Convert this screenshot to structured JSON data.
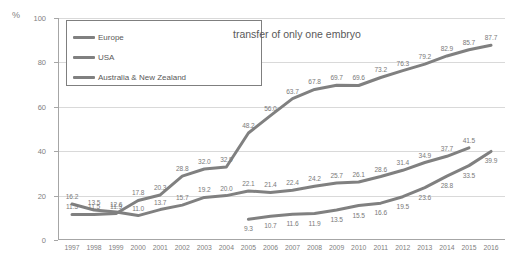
{
  "chart_data": {
    "type": "line",
    "title": "transfer of only one embryo",
    "xlabel": "",
    "ylabel": "%",
    "ylim": [
      0,
      100
    ],
    "yticks": [
      0,
      20,
      40,
      60,
      80,
      100
    ],
    "grid": true,
    "legend_position": "top-left",
    "x": [
      1997,
      1998,
      1999,
      2000,
      2001,
      2002,
      2003,
      2004,
      2005,
      2006,
      2007,
      2008,
      2009,
      2010,
      2011,
      2012,
      2013,
      2014,
      2015,
      2016
    ],
    "categories": [
      "1997",
      "1998",
      "1999",
      "2000",
      "2001",
      "2002",
      "2003",
      "2004",
      "2005",
      "2006",
      "2007",
      "2008",
      "2009",
      "2010",
      "2011",
      "2012",
      "2013",
      "2014",
      "2015",
      "2016"
    ],
    "series": [
      {
        "name": "Europe",
        "color": "#808080",
        "values": [
          16.2,
          13.5,
          12.6,
          11.0,
          13.7,
          15.7,
          19.2,
          20.0,
          22.1,
          21.4,
          22.4,
          24.2,
          25.7,
          26.1,
          28.6,
          31.4,
          34.9,
          37.7,
          41.5,
          null
        ],
        "labels": [
          "16.2",
          "13.5",
          "12.6",
          "11.0",
          "13.7",
          "15.7",
          "19.2",
          "20.0",
          "22.1",
          "21.4",
          "22.4",
          "24.2",
          "25.7",
          "26.1",
          "28.6",
          "31.4",
          "34.9",
          "37.7",
          "41.5",
          ""
        ]
      },
      {
        "name": "USA",
        "color": "#808080",
        "values": [
          null,
          null,
          null,
          null,
          null,
          null,
          null,
          null,
          9.3,
          10.7,
          11.6,
          11.9,
          13.5,
          15.5,
          16.6,
          19.5,
          23.6,
          28.8,
          33.5,
          39.9
        ],
        "labels": [
          "",
          "",
          "",
          "",
          "",
          "",
          "",
          "",
          "9.3",
          "10.7",
          "11.6",
          "11.9",
          "13.5",
          "15.5",
          "16.6",
          "19.5",
          "23.6",
          "28.8",
          "33.5",
          "39.9"
        ]
      },
      {
        "name": "Australia & New Zealand",
        "color": "#808080",
        "values": [
          11.5,
          11.5,
          11.9,
          17.8,
          20.3,
          28.8,
          32.0,
          32.9,
          48.2,
          56.0,
          63.7,
          67.8,
          69.7,
          69.6,
          73.2,
          76.3,
          79.2,
          82.9,
          85.7,
          87.7
        ],
        "labels": [
          "11.5",
          "11.5",
          "11.9",
          "17.8",
          "20.3",
          "28.8",
          "32.0",
          "32.9",
          "48.2",
          "56.0",
          "63.7",
          "67.8",
          "69.7",
          "69.6",
          "73.2",
          "76.3",
          "79.2",
          "82.9",
          "85.7",
          "87.7"
        ]
      }
    ]
  },
  "legend": {
    "items": [
      {
        "label": "Europe"
      },
      {
        "label": "USA"
      },
      {
        "label": "Australia & New Zealand"
      }
    ]
  },
  "axis": {
    "y_unit": "%",
    "y_tick_labels": [
      "0",
      "20",
      "40",
      "60",
      "80",
      "100"
    ]
  }
}
